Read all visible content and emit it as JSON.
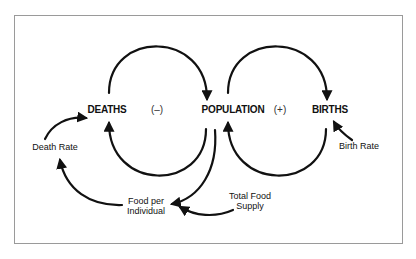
{
  "diagram": {
    "title": "",
    "type": "causal-loop",
    "colors": {
      "stroke": "#111111",
      "frame": "#9a9a9a",
      "background": "#ffffff"
    },
    "nodes": {
      "deaths": "DEATHS",
      "population": "POPULATION",
      "births": "BIRTHS"
    },
    "loop_signs": {
      "negative": "(–)",
      "positive": "(+)"
    },
    "factors": {
      "death_rate": "Death Rate",
      "birth_rate": "Birth Rate",
      "food_per_individual_line1": "Food per",
      "food_per_individual_line2": "Individual",
      "total_food_supply_line1": "Total Food",
      "total_food_supply_line2": "Supply"
    },
    "edges": [
      {
        "from": "DEATHS",
        "to": "POPULATION"
      },
      {
        "from": "POPULATION",
        "to": "DEATHS"
      },
      {
        "from": "POPULATION",
        "to": "BIRTHS"
      },
      {
        "from": "BIRTHS",
        "to": "POPULATION"
      },
      {
        "from": "Death Rate",
        "to": "DEATHS"
      },
      {
        "from": "Birth Rate",
        "to": "BIRTHS"
      },
      {
        "from": "POPULATION",
        "to": "Food per Individual"
      },
      {
        "from": "Total Food Supply",
        "to": "Food per Individual"
      },
      {
        "from": "Food per Individual",
        "to": "Death Rate"
      }
    ]
  }
}
